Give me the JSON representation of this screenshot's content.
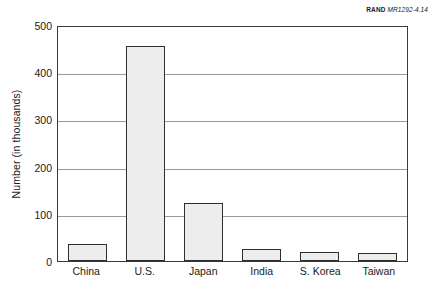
{
  "credit": {
    "brand": "RAND",
    "document_number": "MR1292-4.14"
  },
  "chart_data": {
    "type": "bar",
    "title": "",
    "xlabel": "",
    "ylabel": "Number (in thousands)",
    "categories": [
      "China",
      "U.S.",
      "Japan",
      "India",
      "S. Korea",
      "Taiwan"
    ],
    "values": [
      35,
      455,
      122,
      25,
      20,
      16
    ],
    "ylim": [
      0,
      500
    ],
    "yticks": [
      0,
      100,
      200,
      300,
      400,
      500
    ],
    "ytick_labels": [
      "0",
      "100",
      "200",
      "300",
      "400",
      "500"
    ],
    "grid": true,
    "gridlines_at": [
      100,
      200,
      300,
      400
    ],
    "legend": null,
    "bar_fill_color": "#ededed",
    "bar_edge_color": "#2e2e2e",
    "frame_color": "#3a3a3a",
    "gridline_color": "#9a9a9a",
    "background_color": "#ffffff"
  }
}
